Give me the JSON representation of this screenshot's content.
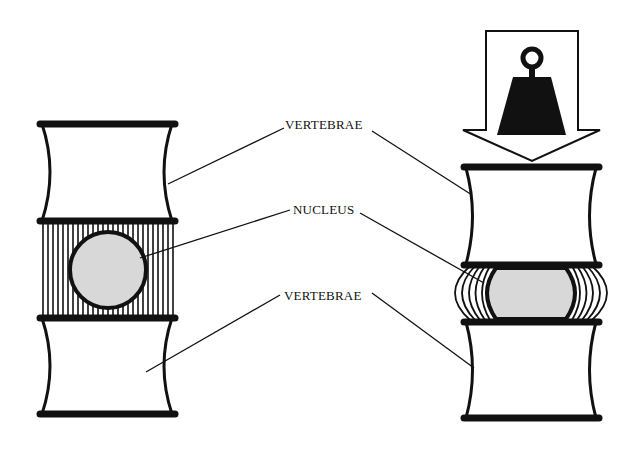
{
  "diagram": {
    "labels": {
      "vertebrae_top": "VERTEBRAE",
      "nucleus": "NUCLEUS",
      "vertebrae_bottom": "VERTEBRAE"
    },
    "left_panel": {
      "state": "unloaded",
      "parts": [
        "vertebra",
        "intervertebral-disc",
        "nucleus",
        "vertebra"
      ]
    },
    "right_panel": {
      "state": "loaded",
      "load_icon": "weight-icon",
      "load_arrow": "down-arrow-icon",
      "parts": [
        "vertebra",
        "compressed-bulging-disc",
        "flattened-nucleus",
        "vertebra"
      ]
    },
    "colors": {
      "ink": "#111111",
      "nucleus_fill": "#d8d8d8",
      "background": "#ffffff"
    }
  }
}
